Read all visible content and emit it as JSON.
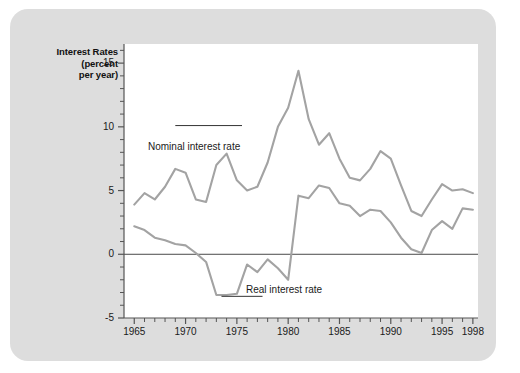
{
  "figure": {
    "background_color": "#ffffff",
    "panel_color": "#dddddd",
    "plot_background": "#ffffff",
    "line_color": "#a3a3a3",
    "axis_color": "#555555",
    "text_color": "#1a1a1a"
  },
  "axis_title": {
    "line1": "Interest Rates",
    "line2": "(percent",
    "line3": "per year)"
  },
  "chart_data": {
    "type": "line",
    "title": "",
    "subtitle": "",
    "xlabel": "",
    "ylabel": "Interest Rates (percent per year)",
    "xlim": [
      1964,
      1998.5
    ],
    "ylim": [
      -5,
      16.5
    ],
    "grid": false,
    "legend": "inline-annotations",
    "xticks": [
      1965,
      1970,
      1975,
      1980,
      1985,
      1990,
      1995,
      1998
    ],
    "xtick_labels": [
      "1965",
      "1970",
      "1975",
      "1980",
      "1985",
      "1990",
      "1995",
      "1998"
    ],
    "xminor_tick_interval": 1,
    "yticks": [
      -5,
      0,
      5,
      10,
      15
    ],
    "ytick_labels": [
      "-5",
      "0",
      "5",
      "10",
      "15"
    ],
    "yminor_tick_interval": 1,
    "zero_line": 0,
    "x": [
      1965,
      1966,
      1967,
      1968,
      1969,
      1970,
      1971,
      1972,
      1973,
      1974,
      1975,
      1976,
      1977,
      1978,
      1979,
      1980,
      1981,
      1982,
      1983,
      1984,
      1985,
      1986,
      1987,
      1988,
      1989,
      1990,
      1991,
      1992,
      1993,
      1994,
      1995,
      1996,
      1997,
      1998
    ],
    "series": [
      {
        "name": "Nominal interest rate",
        "label": "Nominal interest rate",
        "color": "#a3a3a3",
        "values": [
          3.9,
          4.8,
          4.3,
          5.3,
          6.7,
          6.4,
          4.3,
          4.1,
          7.0,
          7.9,
          5.8,
          5.0,
          5.3,
          7.2,
          10.0,
          11.5,
          14.4,
          10.6,
          8.6,
          9.5,
          7.5,
          6.0,
          5.8,
          6.7,
          8.1,
          7.5,
          5.4,
          3.4,
          3.0,
          4.3,
          5.5,
          5.0,
          5.1,
          4.8
        ]
      },
      {
        "name": "Real interest rate",
        "label": "Real interest rate",
        "color": "#a3a3a3",
        "values": [
          2.2,
          1.9,
          1.3,
          1.1,
          0.8,
          0.7,
          0.1,
          -0.6,
          -3.2,
          -3.2,
          -3.1,
          -0.8,
          -1.4,
          -0.4,
          -1.1,
          -2.0,
          4.6,
          4.4,
          5.4,
          5.2,
          4.0,
          3.8,
          3.0,
          3.5,
          3.4,
          2.5,
          1.3,
          0.4,
          0.1,
          1.9,
          2.6,
          2.0,
          3.6,
          3.5
        ]
      }
    ],
    "annotations": [
      {
        "text": "Nominal interest rate",
        "x": 1969.0,
        "y": 10.1,
        "leader_to_x": 1975.5,
        "leader_to_y": 10.1
      },
      {
        "text": "Real interest rate",
        "x": 1977.5,
        "y": -3.3,
        "leader_to_x": 1973.5,
        "leader_to_y": -3.3
      }
    ]
  }
}
